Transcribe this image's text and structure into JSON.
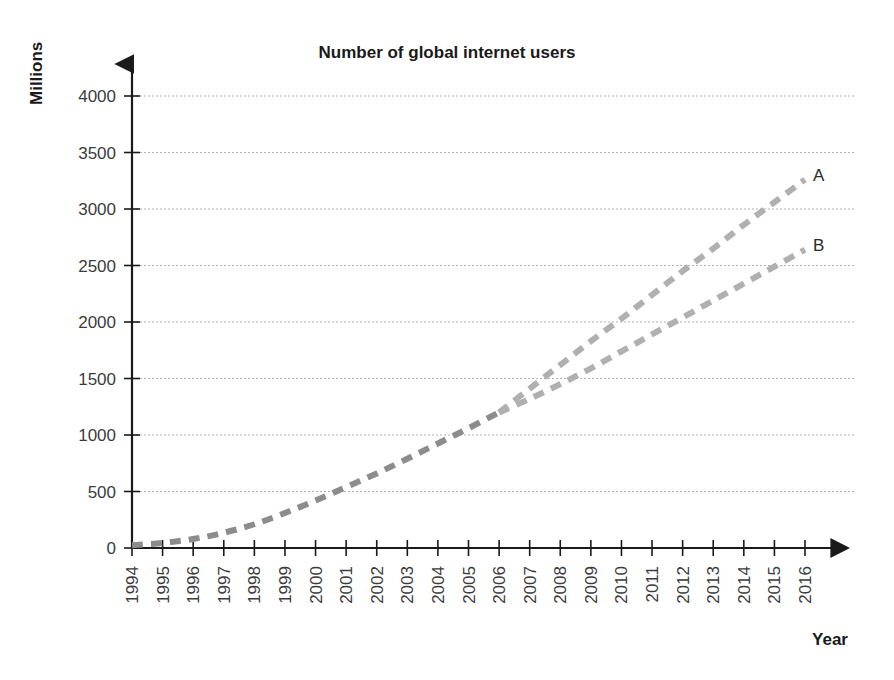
{
  "chart_data": {
    "type": "line",
    "title": "Number of global internet users",
    "xlabel": "Year",
    "ylabel": "Millions",
    "xlim": [
      1994,
      2016
    ],
    "ylim": [
      0,
      4000
    ],
    "grid": true,
    "legend_position": "inline-end-labels",
    "x": [
      1994,
      1995,
      1996,
      1997,
      1998,
      1999,
      2000,
      2001,
      2002,
      2003,
      2004,
      2005,
      2006,
      2007,
      2008,
      2009,
      2010,
      2011,
      2012,
      2013,
      2014,
      2015,
      2016
    ],
    "xticklabels": [
      "1994",
      "1995",
      "1996",
      "1997",
      "1998",
      "1999",
      "2000",
      "2001",
      "2002",
      "2003",
      "2004",
      "2005",
      "2006",
      "2007",
      "2008",
      "2009",
      "2010",
      "2011",
      "2012",
      "2013",
      "2014",
      "2015",
      "2016"
    ],
    "yticks": [
      0,
      500,
      1000,
      1500,
      2000,
      2500,
      3000,
      3500,
      4000
    ],
    "yticklabels": [
      "0",
      "500",
      "1000",
      "1500",
      "2000",
      "2500",
      "3000",
      "3500",
      "4000"
    ],
    "series": [
      {
        "name": "Actual",
        "label": "",
        "style": "dashed",
        "color": "#8c8c8c",
        "x": [
          1994,
          1995,
          1996,
          1997,
          1998,
          1999,
          2000,
          2001,
          2002,
          2003,
          2004,
          2005,
          2006
        ],
        "values": [
          25,
          45,
          80,
          135,
          210,
          310,
          420,
          540,
          660,
          790,
          925,
          1060,
          1200
        ]
      },
      {
        "name": "A",
        "label": "A",
        "style": "dashed",
        "color": "#b0b0b0",
        "x": [
          2006,
          2007,
          2008,
          2009,
          2010,
          2011,
          2012,
          2013,
          2014,
          2015,
          2016
        ],
        "values": [
          1200,
          1410,
          1620,
          1830,
          2030,
          2240,
          2450,
          2650,
          2860,
          3060,
          3260
        ]
      },
      {
        "name": "B",
        "label": "B",
        "style": "dashed",
        "color": "#b0b0b0",
        "x": [
          2006,
          2007,
          2008,
          2009,
          2010,
          2011,
          2012,
          2013,
          2014,
          2015,
          2016
        ],
        "values": [
          1200,
          1320,
          1450,
          1590,
          1740,
          1890,
          2040,
          2190,
          2340,
          2490,
          2640
        ]
      }
    ],
    "annotations": [
      {
        "text": "A",
        "x": 2016,
        "y": 3300
      },
      {
        "text": "B",
        "x": 2016,
        "y": 2680
      }
    ]
  },
  "colors": {
    "axis": "#1a1a1a",
    "grid": "#a8a8a8",
    "series_actual": "#8c8c8c",
    "series_forecast": "#b0b0b0",
    "text": "#2b2b2b",
    "background": "#ffffff"
  }
}
